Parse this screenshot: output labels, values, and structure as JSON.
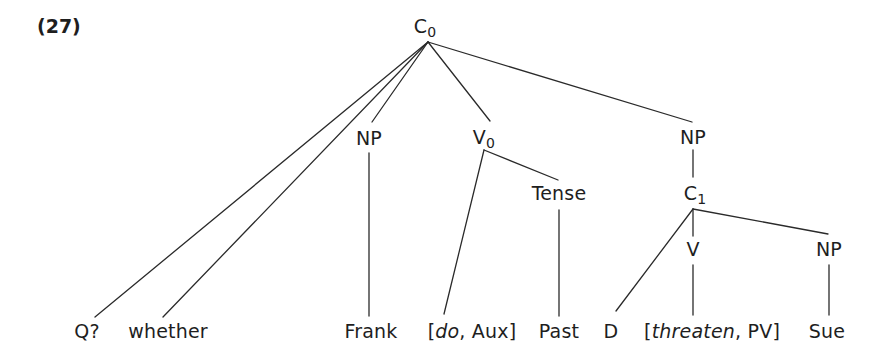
{
  "example": {
    "number": "(27)"
  },
  "tree": {
    "nodes": {
      "c0": {
        "label": "C",
        "sub": "0"
      },
      "np_frank": {
        "label": "NP"
      },
      "v0": {
        "label": "V",
        "sub": "0"
      },
      "tense": {
        "label": "Tense"
      },
      "np_upper": {
        "label": "NP"
      },
      "c1": {
        "label": "C",
        "sub": "1"
      },
      "v": {
        "label": "V"
      },
      "np_sue": {
        "label": "NP"
      }
    },
    "leaves": {
      "q": {
        "text": "Q?"
      },
      "whether": {
        "text": "whether"
      },
      "frank": {
        "text": "Frank"
      },
      "do_aux": {
        "open": "[",
        "italic": "do",
        "rest": ", Aux]"
      },
      "past": {
        "text": "Past"
      },
      "d": {
        "text": "D"
      },
      "threaten_pv": {
        "open": "[",
        "italic": "threaten",
        "rest": ", PV]"
      },
      "sue": {
        "text": "Sue"
      }
    },
    "edges": [
      {
        "from": "C0",
        "to": "Q?"
      },
      {
        "from": "C0",
        "to": "whether"
      },
      {
        "from": "C0",
        "to": "NP"
      },
      {
        "from": "C0",
        "to": "V0"
      },
      {
        "from": "C0",
        "to": "NP"
      },
      {
        "from": "NP",
        "to": "Frank"
      },
      {
        "from": "V0",
        "to": "[do, Aux]"
      },
      {
        "from": "V0",
        "to": "Tense"
      },
      {
        "from": "Tense",
        "to": "Past"
      },
      {
        "from": "NP",
        "to": "C1"
      },
      {
        "from": "C1",
        "to": "D"
      },
      {
        "from": "C1",
        "to": "V"
      },
      {
        "from": "C1",
        "to": "NP"
      },
      {
        "from": "V",
        "to": "[threaten, PV]"
      },
      {
        "from": "NP",
        "to": "Sue"
      }
    ]
  }
}
